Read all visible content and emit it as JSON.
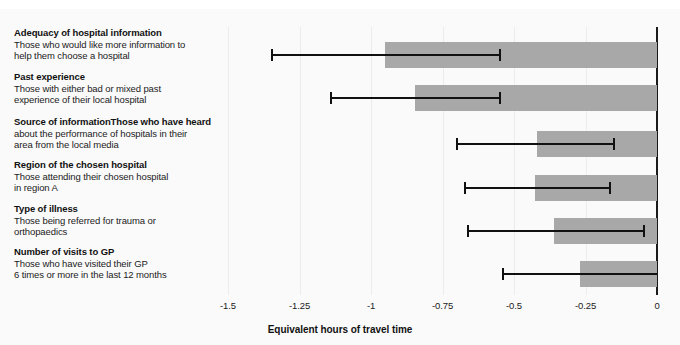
{
  "chart_data": {
    "type": "bar",
    "orientation": "horizontal",
    "title": "",
    "xlabel": "Equivalent hours of travel time",
    "ylabel": "",
    "xlim": [
      -1.5,
      0
    ],
    "xticks": [
      "-1.5",
      "-1.25",
      "-1",
      "-0.75",
      "-0.5",
      "-0.25",
      "0"
    ],
    "xtick_values": [
      -1.5,
      -1.25,
      -1,
      -0.75,
      -0.5,
      -0.25,
      0
    ],
    "grid": true,
    "legend": "none",
    "bar_color": "#a8a8a8",
    "error_color": "#111111",
    "categories": [
      "Adequacy of hospital information",
      "Past experience",
      "Source of information",
      "Region of the chosen hospital",
      "Type of illness",
      "Number of visits to GP"
    ],
    "descriptions": [
      "Those who would like more information to help them choose a hospital",
      "Those with either bad or mixed past experience of their local hospital",
      "Those who have heard about the performance of hospitals in their area from the local media",
      "Those attending their chosen hospital in region A",
      "Those being referred for trauma or orthopaedics",
      "Those who have visited their GP 6 times or more in the last 12 months"
    ],
    "values": [
      -0.95,
      -0.845,
      -0.42,
      -0.425,
      -0.36,
      -0.27
    ],
    "ci_low": [
      -1.345,
      -1.14,
      -0.7,
      -0.67,
      -0.66,
      -0.54
    ],
    "ci_high": [
      -0.548,
      -0.548,
      -0.15,
      -0.165,
      -0.045,
      0.0
    ]
  },
  "rows": [
    {
      "head": "Adequacy of hospital information",
      "desc_line1": "Those who would like more information to",
      "desc_line2": "help them choose a hospital",
      "desc_line3": ""
    },
    {
      "head": "Past experience",
      "desc_line1": "Those with either bad or mixed past",
      "desc_line2": "experience of their local hospital",
      "desc_line3": ""
    },
    {
      "head": "Source of information",
      "desc_line1": "Those who have heard",
      "desc_line2": "about the performance of hospitals in their",
      "desc_line3": "area from the local media"
    },
    {
      "head": "Region of the chosen hospital",
      "desc_line1": "Those attending their chosen hospital",
      "desc_line2": "in region A",
      "desc_line3": ""
    },
    {
      "head": "Type of illness",
      "desc_line1": "Those being referred for trauma or",
      "desc_line2": "orthopaedics",
      "desc_line3": ""
    },
    {
      "head": "Number of visits to GP",
      "desc_line1": "Those who have visited their GP",
      "desc_line2": "6 times or more in the last 12 months",
      "desc_line3": ""
    }
  ],
  "axis": {
    "title": "Equivalent hours of travel time",
    "ticks": [
      "-1.5",
      "-1.25",
      "-1",
      "-0.75",
      "-0.5",
      "-0.25",
      "0"
    ]
  }
}
